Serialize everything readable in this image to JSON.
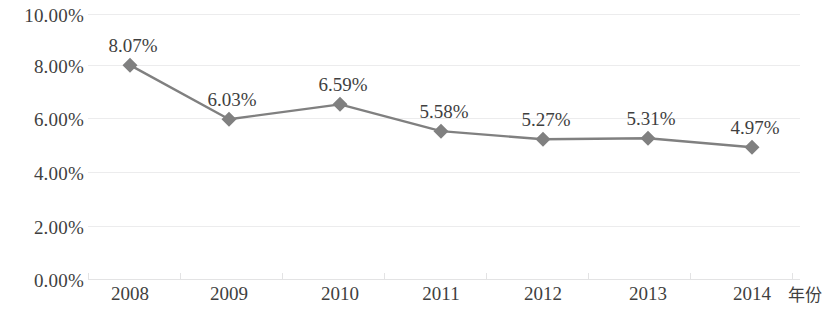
{
  "chart_data": {
    "type": "line",
    "title": "",
    "xlabel": "年份",
    "ylabel": "",
    "categories": [
      "2008",
      "2009",
      "2010",
      "2011",
      "2012",
      "2013",
      "2014"
    ],
    "values": [
      8.07,
      6.03,
      6.59,
      5.58,
      5.27,
      5.31,
      4.97
    ],
    "point_labels": [
      "8.07%",
      "6.03%",
      "6.59%",
      "5.58%",
      "5.27%",
      "5.31%",
      "4.97%"
    ],
    "ylim": [
      0,
      10
    ],
    "ytick_values": [
      10,
      8,
      6,
      4,
      2,
      0
    ],
    "ytick_labels": [
      "10.00%",
      "8.00%",
      "6.00%",
      "4.00%",
      "2.00%",
      "0.00%"
    ],
    "grid": true,
    "legend": false,
    "legend_position": "none",
    "series": [
      {
        "name": "",
        "values": [
          8.07,
          6.03,
          6.59,
          5.58,
          5.27,
          5.31,
          4.97
        ],
        "line_color": "#808080",
        "marker": "diamond",
        "marker_color": "#808080"
      }
    ],
    "colors": {
      "line": "#808080",
      "marker": "#808080",
      "gridline": "#ececed",
      "axis": "#e3e3e4",
      "text": "#3f3f3f",
      "background": "#ffffff"
    }
  }
}
